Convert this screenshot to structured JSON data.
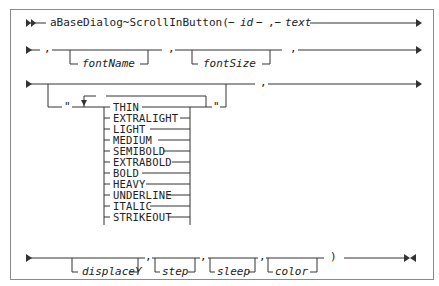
{
  "diagram": {
    "method": "aBaseDialog~ScrollInButton(",
    "sep1": "−",
    "param_id": "id",
    "sep2": "−",
    "comma_text": ",−",
    "param_text": "text",
    "row2": {
      "comma1": ",",
      "fontName": "fontName",
      "comma2": ",",
      "fontSize": "fontSize",
      "comma3": ","
    },
    "row3": {
      "open_quote": "\"",
      "close_quote": "\"",
      "comma": ",",
      "keywords": [
        "THIN",
        "EXTRALIGHT",
        "LIGHT",
        "MEDIUM",
        "SEMIBOLD",
        "EXTRABOLD",
        "BOLD",
        "HEAVY",
        "UNDERLINE",
        "ITALIC",
        "STRIKEOUT"
      ]
    },
    "row4": {
      "displaceY": "displaceY",
      "comma1": ",",
      "step": "step",
      "comma2": ",",
      "sleep": "sleep",
      "comma3": ",",
      "color": "color",
      "close_paren": ")"
    }
  },
  "colors": {
    "line": "#333333",
    "border": "#8a8a8a",
    "text": "#222222"
  }
}
